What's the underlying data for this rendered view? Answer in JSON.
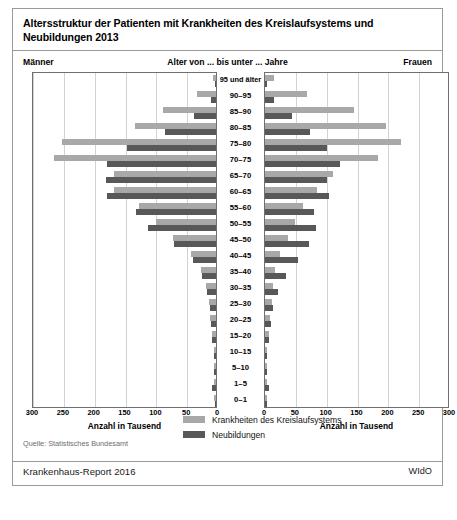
{
  "header": {
    "title_line1": "Altersstruktur der Patienten mit Krankheiten des Kreislaufsystems und",
    "title_line2": "Neubildungen 2013"
  },
  "captions": {
    "left": "Männer",
    "center": "Alter von ... bis unter ... Jahre",
    "right": "Frauen"
  },
  "axis": {
    "left_title": "Anzahl in Tausend",
    "right_title": "Anzahl in Tausend",
    "left_ticks": [
      "300",
      "250",
      "200",
      "150",
      "100",
      "50",
      "0"
    ],
    "right_ticks": [
      "0",
      "50",
      "100",
      "150",
      "200",
      "250",
      "300"
    ]
  },
  "legend": {
    "items": [
      {
        "label": "Krankheiten des Kreislaufsystems",
        "color": "#a8a8a8"
      },
      {
        "label": "Neubildungen",
        "color": "#585858"
      }
    ]
  },
  "footer": {
    "source": "Quelle: Statistisches Bundesamt",
    "report": "Krankenhaus-Report 2016",
    "publisher": "WIdO"
  },
  "colors": {
    "circulatory": "#a8a8a8",
    "neoplasms": "#585858",
    "grid": "#d2d2d2",
    "frame": "#6f6f6f"
  },
  "chart_data": {
    "type": "bar",
    "subtype": "population-pyramid",
    "title": "Altersstruktur der Patienten mit Krankheiten des Kreislaufsystems und Neubildungen 2013",
    "xlabel": "Anzahl in Tausend",
    "ylabel": "Alter von ... bis unter ... Jahre",
    "xlim": [
      0,
      300
    ],
    "xticks": [
      0,
      50,
      100,
      150,
      200,
      250,
      300
    ],
    "grid": true,
    "legend_position": "bottom-center",
    "categories": [
      "95 und älter",
      "90–95",
      "85–90",
      "80–85",
      "75–80",
      "70–75",
      "65–70",
      "60–65",
      "55–60",
      "50–55",
      "45–50",
      "40–45",
      "35–40",
      "30–35",
      "25–30",
      "20–25",
      "15–20",
      "10–15",
      "5–10",
      "1–5",
      "0–1"
    ],
    "series": [
      {
        "name": "Männer – Krankheiten des Kreislaufsystems",
        "side": "left",
        "color": "#a8a8a8",
        "values": [
          5,
          31,
          86,
          131,
          250,
          262,
          165,
          166,
          125,
          97,
          70,
          40,
          25,
          16,
          12,
          9,
          7,
          4,
          3,
          3,
          4
        ]
      },
      {
        "name": "Männer – Neubildungen",
        "side": "left",
        "color": "#585858",
        "values": [
          2,
          8,
          36,
          82,
          145,
          177,
          178,
          176,
          130,
          110,
          68,
          38,
          22,
          14,
          10,
          8,
          6,
          4,
          4,
          6,
          2
        ]
      },
      {
        "name": "Frauen – Krankheiten des Kreislaufsystems",
        "side": "right",
        "color": "#a8a8a8",
        "values": [
          14,
          68,
          145,
          196,
          220,
          184,
          110,
          85,
          62,
          48,
          38,
          25,
          17,
          13,
          11,
          8,
          6,
          4,
          3,
          3,
          3
        ]
      },
      {
        "name": "Frauen – Neubildungen",
        "side": "right",
        "color": "#585858",
        "values": [
          3,
          14,
          43,
          73,
          101,
          122,
          100,
          103,
          80,
          83,
          72,
          54,
          34,
          21,
          13,
          9,
          6,
          4,
          4,
          6,
          2
        ]
      }
    ]
  }
}
